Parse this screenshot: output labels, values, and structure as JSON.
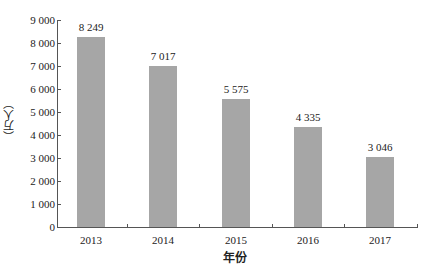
{
  "chart_data": {
    "type": "bar",
    "title": "",
    "xlabel": "年份",
    "ylabel": "（万人）",
    "categories": [
      "2013",
      "2014",
      "2015",
      "2016",
      "2017"
    ],
    "values": [
      8249,
      7017,
      5575,
      4335,
      3046
    ],
    "value_labels": [
      "8 249",
      "7 017",
      "5 575",
      "4 335",
      "3 046"
    ],
    "ylim": [
      0,
      9000
    ],
    "yticks": [
      0,
      1000,
      2000,
      3000,
      4000,
      5000,
      6000,
      7000,
      8000,
      9000
    ],
    "ytick_labels": [
      "0",
      "1 000",
      "2 000",
      "3 000",
      "4 000",
      "5 000",
      "6 000",
      "7 000",
      "8 000",
      "9 000"
    ],
    "grid": false,
    "legend": null,
    "bar_color": "#a6a6a6"
  }
}
